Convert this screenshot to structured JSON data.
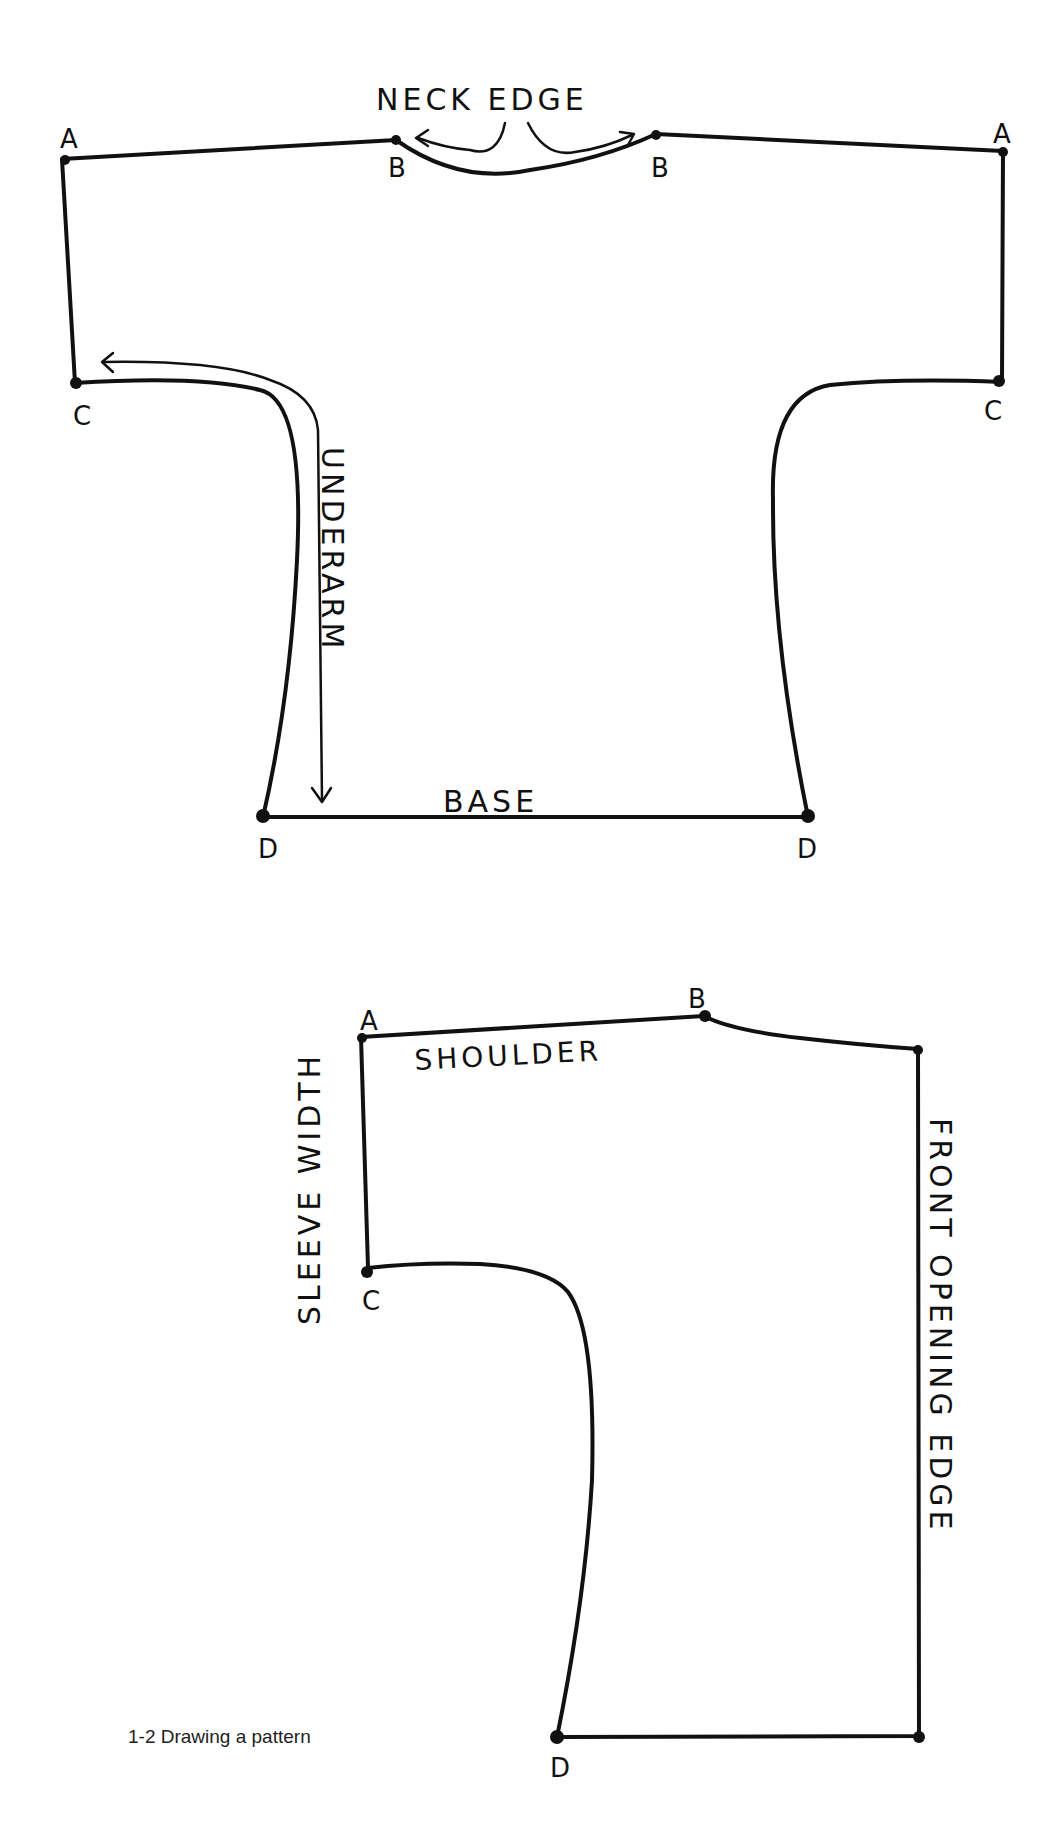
{
  "figure": {
    "caption": "1-2  Drawing a pattern"
  },
  "top_pattern": {
    "labels": {
      "neck_edge": "NECK EDGE",
      "underarm": "UNDERARM",
      "base": "BASE"
    },
    "points": {
      "a_left": "A",
      "a_right": "A",
      "b_left": "B",
      "b_right": "B",
      "c_left": "C",
      "c_right": "C",
      "d_left": "D",
      "d_right": "D"
    }
  },
  "bottom_pattern": {
    "labels": {
      "shoulder": "SHOULDER",
      "sleeve_width": "SLEEVE WIDTH",
      "front_opening_edge": "FRONT OPENING EDGE"
    },
    "points": {
      "a": "A",
      "b": "B",
      "c": "C",
      "d": "D"
    }
  },
  "colors": {
    "ink": "#111111",
    "paper": "#ffffff"
  }
}
